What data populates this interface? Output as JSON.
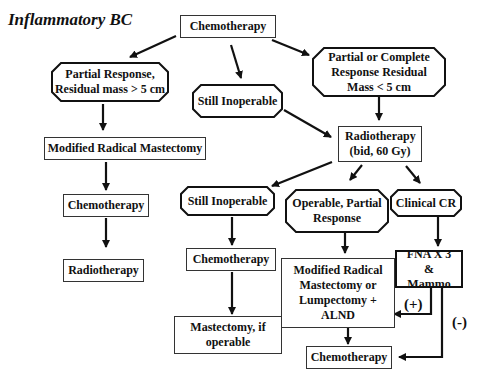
{
  "title": "Inflammatory BC",
  "nodes": {
    "chemo_top": "Chemotherapy",
    "partial_gt5": "Partial Response, Residual mass > 5 cm",
    "still_inoperable_1": "Still Inoperable",
    "partial_complete_lt5": "Partial or Complete Response Residual Mass < 5 cm",
    "mrm_left": "Modified Radical Mastectomy",
    "radiotherapy_mid": "Radiotherapy (bid, 60 Gy)",
    "chemo_left": "Chemotherapy",
    "radiotherapy_left": "Radiotherapy",
    "still_inoperable_2": "Still Inoperable",
    "operable_partial": "Operable, Partial Response",
    "clinical_cr": "Clinical CR",
    "chemo_mid": "Chemotherapy",
    "mrm_or_lumpectomy": "Modified Radical Mastectomy or Lumpectomy + ALND",
    "fna_mammo": "FNA X 3 & Mammo",
    "mastectomy_if_operable": "Mastectomy, if operable",
    "chemo_bottom": "Chemotherapy"
  },
  "edge_labels": {
    "positive": "(+)",
    "negative": "(-)"
  },
  "colors": {
    "line": "#111111",
    "background": "#ffffff"
  }
}
